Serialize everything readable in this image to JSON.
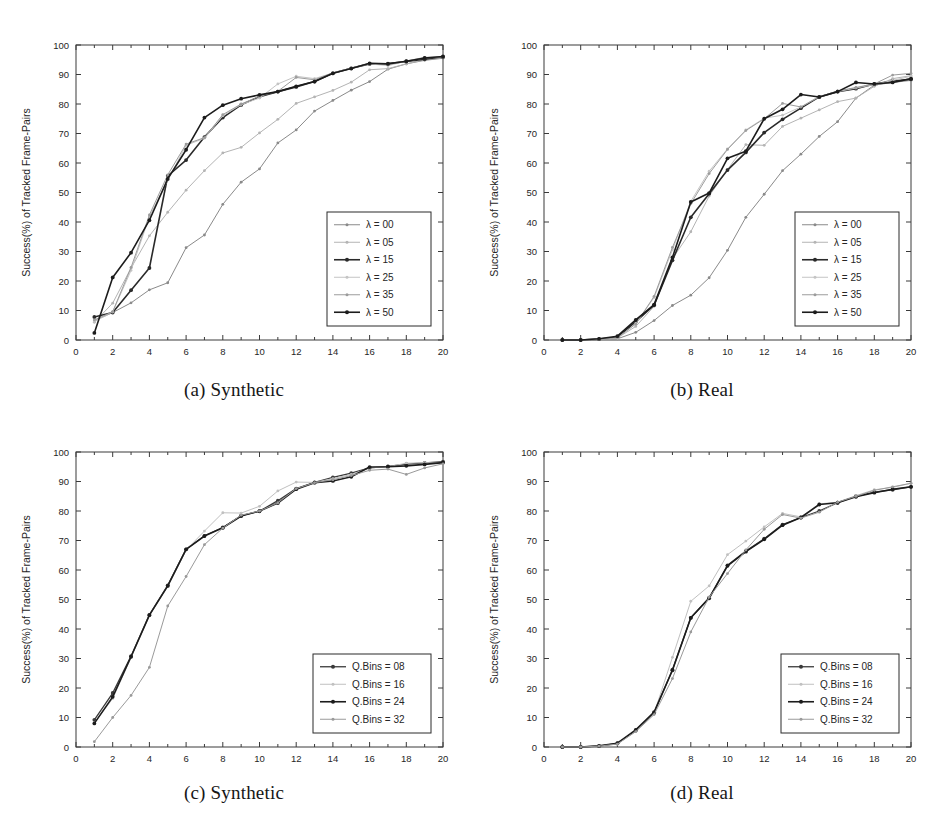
{
  "figure": {
    "axis_x_title": "Average Error (mm)",
    "axis_y_title": "Success(%) of Tracked Frame-Pairs",
    "x_ticks": [
      0,
      2,
      4,
      6,
      8,
      10,
      12,
      14,
      16,
      18,
      20
    ],
    "y_ticks": [
      0,
      10,
      20,
      30,
      40,
      50,
      60,
      70,
      80,
      90,
      100
    ],
    "captions": {
      "a": "(a) Synthetic",
      "b": "(b) Real",
      "c": "(c) Synthetic",
      "d": "(d) Real"
    }
  },
  "chart_data": [
    {
      "id": "panel-a",
      "type": "line",
      "title": "(a) Synthetic",
      "xlabel": "Average Error (mm)",
      "ylabel": "Success(%) of Tracked Frame-Pairs",
      "xlim": [
        0,
        20
      ],
      "ylim": [
        0,
        100
      ],
      "xticks": [
        0,
        2,
        4,
        6,
        8,
        10,
        12,
        14,
        16,
        18,
        20
      ],
      "yticks": [
        0,
        10,
        20,
        30,
        40,
        50,
        60,
        70,
        80,
        90,
        100
      ],
      "grid": false,
      "legend_position": "lower right",
      "x": [
        1,
        2,
        3,
        4,
        5,
        6,
        7,
        8,
        9,
        10,
        11,
        12,
        13,
        14,
        15,
        16,
        17,
        18,
        19,
        20
      ],
      "series": [
        {
          "name": "λ = 00",
          "color": "#8a8a8a",
          "width": 1.0,
          "values": [
            6.5,
            9.3,
            12.6,
            17.0,
            19.4,
            31.3,
            35.6,
            46.0,
            53.5,
            58.0,
            66.8,
            71.2,
            77.6,
            81.2,
            84.7,
            87.6,
            91.8,
            93.6,
            94.8,
            95.5
          ]
        },
        {
          "name": "λ = 05",
          "color": "#b4b4b4",
          "width": 1.0,
          "values": [
            6.0,
            12.5,
            24.4,
            35.3,
            43.3,
            50.8,
            57.4,
            63.4,
            65.3,
            70.2,
            74.8,
            80.2,
            82.4,
            84.6,
            87.4,
            91.6,
            92.0,
            93.6,
            95.0,
            95.8
          ]
        },
        {
          "name": "λ = 15",
          "color": "#2a2a2a",
          "width": 1.6,
          "values": [
            7.8,
            9.3,
            16.9,
            24.4,
            55.6,
            61.0,
            68.8,
            75.4,
            79.7,
            82.5,
            84.2,
            85.8,
            87.6,
            90.4,
            92.1,
            93.6,
            93.7,
            94.4,
            95.2,
            96.0
          ]
        },
        {
          "name": "λ = 25",
          "color": "#c4c4c4",
          "width": 1.0,
          "values": [
            6.3,
            9.5,
            23.6,
            41.8,
            54.2,
            66.0,
            68.4,
            76.0,
            79.8,
            82.0,
            86.8,
            89.4,
            88.6,
            90.5,
            92.2,
            93.6,
            93.0,
            94.5,
            95.6,
            96.0
          ]
        },
        {
          "name": "λ = 35",
          "color": "#9c9c9c",
          "width": 1.0,
          "values": [
            6.8,
            9.6,
            24.6,
            42.4,
            56.0,
            66.4,
            68.6,
            76.4,
            80.0,
            82.6,
            84.3,
            89.0,
            88.2,
            90.6,
            92.2,
            93.8,
            93.4,
            94.6,
            95.8,
            96.0
          ]
        },
        {
          "name": "λ = 50",
          "color": "#1c1c1c",
          "width": 1.6,
          "values": [
            2.4,
            21.2,
            29.6,
            40.6,
            54.6,
            64.5,
            75.4,
            79.6,
            81.8,
            83.1,
            84.2,
            86.0,
            87.6,
            90.4,
            92.0,
            93.8,
            93.6,
            94.5,
            95.6,
            96.1
          ]
        }
      ]
    },
    {
      "id": "panel-b",
      "type": "line",
      "title": "(b) Real",
      "xlabel": "Average Error (mm)",
      "ylabel": "Success(%) of Tracked Frame-Pairs",
      "xlim": [
        0,
        20
      ],
      "ylim": [
        0,
        100
      ],
      "xticks": [
        0,
        2,
        4,
        6,
        8,
        10,
        12,
        14,
        16,
        18,
        20
      ],
      "yticks": [
        0,
        10,
        20,
        30,
        40,
        50,
        60,
        70,
        80,
        90,
        100
      ],
      "grid": false,
      "legend_position": "lower right",
      "x": [
        1,
        2,
        3,
        4,
        5,
        6,
        7,
        8,
        9,
        10,
        11,
        12,
        13,
        14,
        15,
        16,
        17,
        18,
        19,
        20
      ],
      "series": [
        {
          "name": "λ = 00",
          "color": "#8a8a8a",
          "width": 1.0,
          "values": [
            0.0,
            0.0,
            0.2,
            0.4,
            2.6,
            6.6,
            11.7,
            15.2,
            21.1,
            30.4,
            41.6,
            49.4,
            57.4,
            63.0,
            69.0,
            74.0,
            82.0,
            86.4,
            87.3,
            88.0
          ]
        },
        {
          "name": "λ = 05",
          "color": "#b4b4b4",
          "width": 1.0,
          "values": [
            0.0,
            0.0,
            0.2,
            0.7,
            4.6,
            11.4,
            27.6,
            36.7,
            48.8,
            57.8,
            66.2,
            66.0,
            72.4,
            75.2,
            78.0,
            80.8,
            82.0,
            86.0,
            88.6,
            89.6
          ]
        },
        {
          "name": "λ = 15",
          "color": "#2a2a2a",
          "width": 1.6,
          "values": [
            0.0,
            0.0,
            0.3,
            0.9,
            6.2,
            11.8,
            27.0,
            41.6,
            49.6,
            57.6,
            63.6,
            70.3,
            74.8,
            78.6,
            82.4,
            84.2,
            85.2,
            86.8,
            87.8,
            88.4
          ]
        },
        {
          "name": "λ = 25",
          "color": "#c4c4c4",
          "width": 1.0,
          "values": [
            0.0,
            0.0,
            0.2,
            0.6,
            5.6,
            14.4,
            30.6,
            47.0,
            57.2,
            64.8,
            71.2,
            75.2,
            76.2,
            79.0,
            82.6,
            84.2,
            85.4,
            86.6,
            88.0,
            89.4
          ]
        },
        {
          "name": "λ = 35",
          "color": "#9c9c9c",
          "width": 1.0,
          "values": [
            0.0,
            0.0,
            0.2,
            0.8,
            5.4,
            14.8,
            31.4,
            46.2,
            56.4,
            64.6,
            71.0,
            75.0,
            80.2,
            79.0,
            82.4,
            84.4,
            85.6,
            86.8,
            89.8,
            90.4
          ]
        },
        {
          "name": "λ = 50",
          "color": "#1c1c1c",
          "width": 1.6,
          "values": [
            0.0,
            0.0,
            0.4,
            1.3,
            6.8,
            12.0,
            28.0,
            46.8,
            49.8,
            61.6,
            64.0,
            75.0,
            78.2,
            83.2,
            82.4,
            84.2,
            87.3,
            86.8,
            87.3,
            88.6
          ]
        }
      ]
    },
    {
      "id": "panel-c",
      "type": "line",
      "title": "(c) Synthetic",
      "xlabel": "Average Error (mm)",
      "ylabel": "Success(%) of Tracked Frame-Pairs",
      "xlim": [
        0,
        20
      ],
      "ylim": [
        0,
        100
      ],
      "xticks": [
        0,
        2,
        4,
        6,
        8,
        10,
        12,
        14,
        16,
        18,
        20
      ],
      "yticks": [
        0,
        10,
        20,
        30,
        40,
        50,
        60,
        70,
        80,
        90,
        100
      ],
      "grid": false,
      "legend_position": "lower right",
      "x": [
        1,
        2,
        3,
        4,
        5,
        6,
        7,
        8,
        9,
        10,
        11,
        12,
        13,
        14,
        15,
        16,
        17,
        18,
        19,
        20
      ],
      "series": [
        {
          "name": "Q.Bins = 08",
          "color": "#3a3a3a",
          "width": 1.3,
          "values": [
            9.2,
            18.3,
            30.8,
            44.8,
            54.8,
            67.0,
            71.6,
            74.4,
            78.4,
            79.9,
            83.5,
            87.6,
            89.7,
            91.4,
            92.8,
            94.6,
            95.1,
            95.9,
            96.3,
            96.7
          ]
        },
        {
          "name": "Q.Bins = 16",
          "color": "#c0c0c0",
          "width": 1.0,
          "values": [
            8.2,
            16.4,
            30.4,
            44.6,
            54.6,
            66.8,
            73.2,
            79.4,
            79.3,
            81.6,
            86.8,
            89.8,
            89.7,
            91.0,
            92.4,
            94.6,
            95.0,
            96.2,
            96.4,
            96.2
          ]
        },
        {
          "name": "Q.Bins = 24",
          "color": "#1c1c1c",
          "width": 1.6,
          "values": [
            8.0,
            17.0,
            30.6,
            44.7,
            54.6,
            67.0,
            71.5,
            74.3,
            78.3,
            80.0,
            82.7,
            87.4,
            89.6,
            90.2,
            91.6,
            94.9,
            95.0,
            95.3,
            95.8,
            96.4
          ]
        },
        {
          "name": "Q.Bins = 32",
          "color": "#9a9a9a",
          "width": 1.0,
          "values": [
            1.8,
            10.0,
            17.5,
            27.0,
            47.8,
            57.8,
            68.6,
            74.2,
            78.6,
            80.0,
            82.8,
            87.6,
            89.6,
            90.6,
            92.0,
            93.8,
            94.2,
            92.4,
            94.6,
            96.0
          ]
        }
      ]
    },
    {
      "id": "panel-d",
      "type": "line",
      "title": "(d) Real",
      "xlabel": "Average Error (mm)",
      "ylabel": "Success(%) of Tracked Frame-Pairs",
      "xlim": [
        0,
        20
      ],
      "ylim": [
        0,
        100
      ],
      "xticks": [
        0,
        2,
        4,
        6,
        8,
        10,
        12,
        14,
        16,
        18,
        20
      ],
      "yticks": [
        0,
        10,
        20,
        30,
        40,
        50,
        60,
        70,
        80,
        90,
        100
      ],
      "grid": false,
      "legend_position": "lower right",
      "x": [
        1,
        2,
        3,
        4,
        5,
        6,
        7,
        8,
        9,
        10,
        11,
        12,
        13,
        14,
        15,
        16,
        17,
        18,
        19,
        20
      ],
      "series": [
        {
          "name": "Q.Bins = 08",
          "color": "#3a3a3a",
          "width": 1.3,
          "values": [
            0.0,
            0.0,
            0.3,
            1.2,
            5.6,
            11.6,
            26.2,
            43.8,
            50.6,
            61.6,
            66.4,
            70.6,
            75.4,
            77.8,
            80.0,
            82.8,
            85.0,
            86.4,
            87.2,
            88.2
          ]
        },
        {
          "name": "Q.Bins = 16",
          "color": "#c0c0c0",
          "width": 1.0,
          "values": [
            0.0,
            0.0,
            0.3,
            1.0,
            5.4,
            11.4,
            30.4,
            49.4,
            54.6,
            65.2,
            69.8,
            74.6,
            79.2,
            78.0,
            82.4,
            83.0,
            85.2,
            87.2,
            88.0,
            89.4
          ]
        },
        {
          "name": "Q.Bins = 24",
          "color": "#1c1c1c",
          "width": 1.6,
          "values": [
            0.0,
            0.0,
            0.4,
            1.3,
            5.8,
            11.8,
            26.0,
            43.8,
            50.4,
            61.4,
            66.2,
            70.4,
            75.2,
            77.8,
            82.2,
            82.8,
            84.8,
            86.2,
            87.4,
            88.2
          ]
        },
        {
          "name": "Q.Bins = 32",
          "color": "#9a9a9a",
          "width": 1.0,
          "values": [
            0.0,
            0.0,
            0.3,
            1.0,
            5.2,
            11.0,
            23.2,
            39.0,
            50.8,
            58.8,
            66.8,
            73.8,
            78.8,
            77.6,
            79.6,
            83.0,
            85.0,
            87.0,
            88.2,
            89.4
          ]
        }
      ]
    }
  ]
}
